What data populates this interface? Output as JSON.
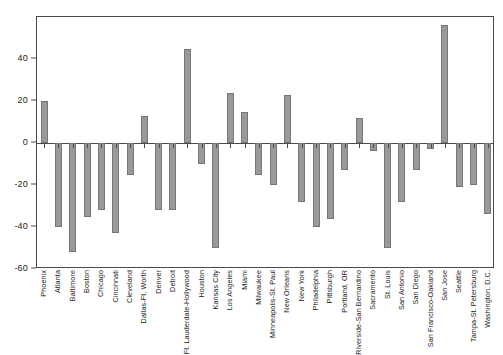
{
  "chart_data": {
    "type": "bar",
    "title": "",
    "subtitle": "",
    "xlabel": "",
    "ylabel": "",
    "ylim": [
      -60,
      60
    ],
    "yticks": [
      40,
      20,
      0,
      -20,
      -40,
      -60
    ],
    "grid": false,
    "legend": null,
    "legend_position": "none",
    "bar_color": "#999999",
    "bar_edge_color": "#777777",
    "axis_color": "#4a4a4a",
    "categories": [
      "Phoenix",
      "Atlanta",
      "Baltimore",
      "Boston",
      "Chicago",
      "Cincinnati",
      "Cleveland",
      "Dallas-Ft. Worth",
      "Denver",
      "Detroit",
      "Ft. Lauderdale-Hollywood",
      "Houston",
      "Kansas City",
      "Los Angeles",
      "Miami",
      "Milwaukee",
      "Minneapolis-St. Paul",
      "New Orleans",
      "New York",
      "Philadelphia",
      "Pittsburgh",
      "Portland, OR",
      "Riverside-San Bernardino",
      "Sacramento",
      "St. Louis",
      "San Antonio",
      "San Diego",
      "San Francisco-Oakland",
      "San Jose",
      "Seattle",
      "Tampa-St. Petersburg",
      "Washington, D.C."
    ],
    "values": [
      20,
      -40,
      -52,
      -35,
      -32,
      -43,
      -15,
      13,
      -32,
      -32,
      45,
      -10,
      -50,
      24,
      15,
      -15,
      -20,
      23,
      -28,
      -40,
      -36,
      -13,
      12,
      -4,
      -50,
      -28,
      -13,
      -3,
      56,
      -21,
      -20,
      -34
    ]
  }
}
